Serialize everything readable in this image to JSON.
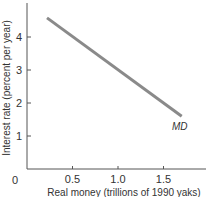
{
  "chart_data": {
    "type": "line",
    "title": "",
    "xlabel": "Real money (trillions of 1990 yaks)",
    "ylabel": "Interest rate (percent per year)",
    "xlim": [
      0,
      1.9
    ],
    "ylim": [
      0,
      5.2
    ],
    "x_ticks": [
      0.5,
      1.0,
      1.5
    ],
    "x_tick_labels": [
      "0.5",
      "1.0",
      "1.5"
    ],
    "y_ticks": [
      1,
      2,
      3,
      4
    ],
    "y_tick_labels": [
      "1",
      "2",
      "3",
      "4"
    ],
    "origin_label": "0",
    "grid": false,
    "legend": "none",
    "series": [
      {
        "name": "MD",
        "label": "MD",
        "color": "#8a8a8a",
        "x": [
          0.22,
          1.7
        ],
        "y": [
          4.58,
          1.6
        ]
      }
    ]
  }
}
